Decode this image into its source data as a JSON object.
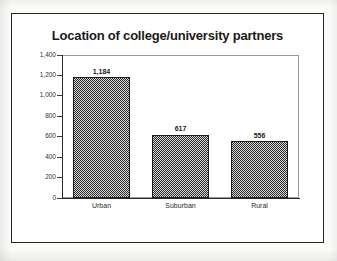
{
  "chart_data": {
    "type": "bar",
    "title": "Location of college/university partners",
    "xlabel": "",
    "ylabel": "",
    "categories": [
      "Urban",
      "Suburban",
      "Rural"
    ],
    "values": [
      1184,
      617,
      556
    ],
    "value_labels": [
      "1,184",
      "617",
      "556"
    ],
    "ylim": [
      0,
      1400
    ],
    "ytick_values": [
      0,
      200,
      400,
      600,
      800,
      1000,
      1200,
      1400
    ],
    "ytick_labels": [
      "0",
      "200",
      "400",
      "600",
      "800",
      "1,000",
      "1,200",
      "1,400"
    ],
    "grid": false,
    "legend": false,
    "legend_position": "none",
    "bar_fill": "dark-checkered-pattern",
    "colors": {
      "bar_fill": "#3c3c3c",
      "bar_border": "#1e1e1e",
      "axis": "#2b2b2b",
      "plot_border": "#9a9a9a",
      "frame": "#262626",
      "text": "#1a1a1a",
      "page_background": "#fbfbfa"
    }
  }
}
